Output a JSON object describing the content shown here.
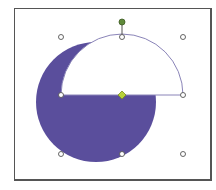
{
  "canvas": {
    "background": "#ffffff",
    "frame_border": "#555555"
  },
  "shapes": {
    "circle": {
      "fill": "#5a4e9c",
      "cx": 96,
      "cy": 102,
      "r": 60
    },
    "semicircle": {
      "fill": "#ffffff",
      "stroke": "#8a84b8",
      "cx": 122,
      "cy": 95,
      "r": 61
    }
  },
  "selection": {
    "handle_fill": "#ffffff",
    "handle_stroke": "#555555",
    "rotation_handle_color": "#5f8a3a",
    "adjust_handle_color": "#b8d23a"
  }
}
